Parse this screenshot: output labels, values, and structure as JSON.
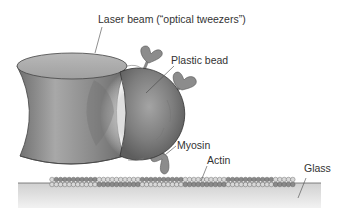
{
  "figure": {
    "labels": {
      "laser": "Laser beam (“optical tweezers”)",
      "bead": "Plastic bead",
      "myosin": "Myosin",
      "actin": "Actin",
      "glass": "Glass"
    },
    "colors": {
      "background": "#ffffff",
      "beam": "#8a8a8a",
      "bead": "#777777",
      "myosin": "#8c8c8c",
      "glass": "#dcdcdc",
      "actin_light": "#d8d8d8",
      "actin_dark": "#8a8a8a",
      "text": "#333333"
    }
  }
}
